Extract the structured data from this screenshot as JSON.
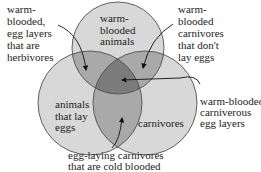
{
  "diagram": {
    "type": "venn",
    "sets": [
      {
        "name": "warm-blooded animals",
        "label": "warm-\nblooded\nanimals"
      },
      {
        "name": "animals that lay eggs",
        "label": "animals\nthat lay\neggs"
      },
      {
        "name": "carnivores",
        "label": "carnivores"
      }
    ],
    "callouts": [
      {
        "id": "top-left",
        "text": "warm-\nblooded,\negg layers\nthat are\nherbivores",
        "points_to": "warm-blooded ∩ lay eggs"
      },
      {
        "id": "top-right",
        "text": "warm-\nblooded\ncarnivores\nthat don't\nlay eggs",
        "points_to": "warm-blooded ∩ carnivores"
      },
      {
        "id": "right",
        "text": "warm-blooded\ncarniverous\negg layers",
        "points_to": "all three"
      },
      {
        "id": "bottom",
        "text": "egg-laying carnivores\nthat are cold blooded",
        "points_to": "lay eggs ∩ carnivores"
      }
    ],
    "colors": {
      "single": "#d8d8d8",
      "double": "#a9a9a9",
      "triple": "#7b7b7b",
      "outline": "#505050",
      "text": "#222222"
    }
  }
}
